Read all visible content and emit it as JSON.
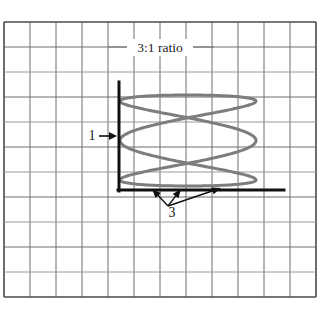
{
  "figure": {
    "background_color": "#ffffff"
  },
  "grid": {
    "name": "graph-paper-grid",
    "line_color": "#6f6f6f",
    "line_color_light": "#9a9a9a",
    "border_color": "#4a4a4a",
    "x_start": 4,
    "y_start": 22,
    "cell_width": 26,
    "cell_height": 25,
    "columns": 12,
    "rows": 11,
    "x_end": 316,
    "y_end": 297
  },
  "axes": {
    "name": "oscilloscope-axes",
    "color": "#111111",
    "stroke_width": 3,
    "vertical": {
      "x": 119,
      "y_top": 82,
      "y_bottom": 191
    },
    "horizontal": {
      "y": 190,
      "x_left": 118,
      "x_right": 284
    }
  },
  "chart_data": {
    "type": "line",
    "title": "3:1 ratio",
    "subtitle": "",
    "xlabel": "",
    "ylabel": "",
    "grid": true,
    "legend_position": "none",
    "curve_name": "lissajous-3-to-1",
    "curve_color": "#7d7d7d",
    "curve_stroke_width": 3,
    "lissajous": {
      "frequency_ratio_x": 3,
      "frequency_ratio_y": 1,
      "ratio_label": "3:1 ratio",
      "horizontal_loops": 3,
      "vertical_loops": 1,
      "phase_deg": 90,
      "x_min": 120,
      "x_max": 256,
      "y_min": 95,
      "y_max": 186,
      "x_center": 188,
      "y_center": 140.5,
      "x_amplitude": 68,
      "y_amplitude": 45.5,
      "samples": 400
    },
    "annotations": [
      {
        "name": "vertical-count-annotation",
        "label": "1",
        "meaning": "one vertical loop touching the vertical axis",
        "label_x": 92,
        "label_y": 140,
        "arrow_from_x": 99,
        "arrow_from_y": 136,
        "arrow_to_x": 117,
        "arrow_to_y": 136
      },
      {
        "name": "horizontal-count-annotation",
        "label": "3",
        "meaning": "three horizontal loops touching the horizontal axis",
        "label_x": 172,
        "label_y": 217,
        "arrow_origin_x": 168,
        "arrow_origin_y": 206,
        "targets": [
          {
            "x": 152,
            "y": 189
          },
          {
            "x": 181,
            "y": 189
          },
          {
            "x": 221,
            "y": 188
          }
        ]
      },
      {
        "name": "ratio-label",
        "label": "3:1 ratio",
        "label_x": 160,
        "label_y": 52,
        "leader_line_y": 47,
        "leader_left_x1": 108,
        "leader_left_x2": 130,
        "leader_right_x1": 192,
        "leader_right_x2": 214
      }
    ]
  },
  "labels": {
    "ratio": "3:1 ratio",
    "vertical_count": "1",
    "horizontal_count": "3"
  }
}
